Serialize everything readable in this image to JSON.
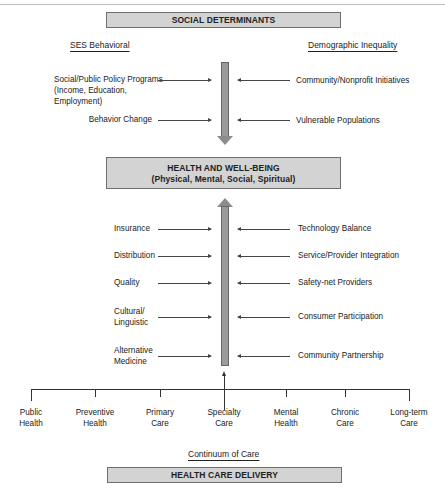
{
  "diagram": {
    "top_box": {
      "label": "SOCIAL DETERMINANTS"
    },
    "left_header": "SES Behavioral",
    "right_header": "Demographic Inequality",
    "social_left": [
      {
        "lines": [
          "Social/Public Policy Programs",
          "(Income, Education,",
          "Employment)"
        ]
      },
      {
        "lines": [
          "Behavior Change"
        ]
      }
    ],
    "social_right": [
      {
        "label": "Community/Nonprofit Initiatives"
      },
      {
        "label": "Vulnerable Populations"
      }
    ],
    "center_box": {
      "title": "HEALTH AND WELL-BEING",
      "subtitle": "(Physical, Mental, Social, Spiritual)"
    },
    "delivery_left": [
      {
        "lines": [
          "Insurance"
        ]
      },
      {
        "lines": [
          "Distribution"
        ]
      },
      {
        "lines": [
          "Quality"
        ]
      },
      {
        "lines": [
          "Cultural/",
          "Linguistic"
        ]
      },
      {
        "lines": [
          "Alternative",
          "Medicine"
        ]
      }
    ],
    "delivery_right": [
      {
        "label": "Technology Balance"
      },
      {
        "label": "Service/Provider Integration"
      },
      {
        "label": "Safety-net Providers"
      },
      {
        "label": "Consumer Participation"
      },
      {
        "label": "Community Partnership"
      }
    ],
    "continuum": [
      {
        "lines": [
          "Public",
          "Health"
        ]
      },
      {
        "lines": [
          "Preventive",
          "Health"
        ]
      },
      {
        "lines": [
          "Primary",
          "Care"
        ]
      },
      {
        "lines": [
          "Specialty",
          "Care"
        ]
      },
      {
        "lines": [
          "Mental",
          "Health"
        ]
      },
      {
        "lines": [
          "Chronic",
          "Care"
        ]
      },
      {
        "lines": [
          "Long-term",
          "Care"
        ]
      }
    ],
    "continuum_header": "Continuum of Care",
    "bottom_box": {
      "label": "HEALTH CARE DELIVERY"
    },
    "colors": {
      "box_fill": "#d3d3d3",
      "arrow_fill": "#9a9a9a",
      "line": "#444444"
    }
  }
}
